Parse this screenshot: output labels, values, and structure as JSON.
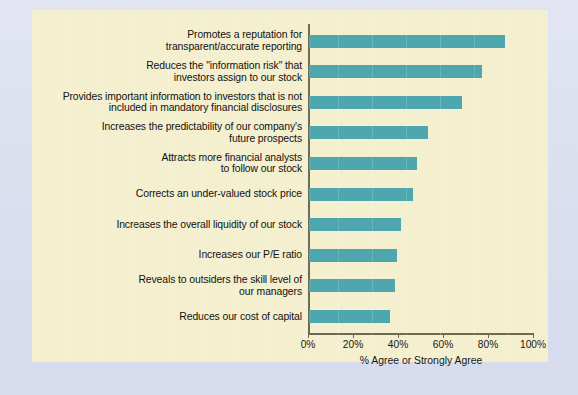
{
  "chart_data": {
    "type": "bar",
    "orientation": "horizontal",
    "title": "",
    "xlabel": "% Agree or Strongly Agree",
    "ylabel": "",
    "xlim": [
      0,
      100
    ],
    "xticks": [
      "0%",
      "20%",
      "40%",
      "60%",
      "80%",
      "100%"
    ],
    "xtick_values": [
      0,
      20,
      40,
      60,
      80,
      100
    ],
    "grid": false,
    "legend": null,
    "bar_color": "#4ea7ae",
    "panel_color": "#f4efcf",
    "page_color": "#dadeee",
    "categories": [
      "Promotes a reputation for transparent/accurate reporting",
      "Reduces the \"information risk\" that investors assign to our stock",
      "Provides important information to investors that is not included in mandatory financial disclosures",
      "Increases the predictability of our company's future prospects",
      "Attracts more financial analysts to follow our stock",
      "Corrects an under-valued stock price",
      "Increases the overall liquidity of our stock",
      "Increases our P/E ratio",
      "Reveals to outsiders the skill level of our managers",
      "Reduces our cost of capital"
    ],
    "values": [
      87,
      77,
      68,
      53,
      48,
      46,
      41,
      39,
      38,
      36
    ]
  },
  "rows": [
    {
      "line1": "Promotes a reputation for",
      "line2": "transparent/accurate reporting",
      "value": 87
    },
    {
      "line1": "Reduces the \"information risk\" that",
      "line2": "investors assign to our stock",
      "value": 77
    },
    {
      "line1": "Provides important information to investors that is not",
      "line2": "included in mandatory financial disclosures",
      "value": 68
    },
    {
      "line1": "Increases the predictability of our company's",
      "line2": "future prospects",
      "value": 53
    },
    {
      "line1": "Attracts more financial analysts",
      "line2": "to follow our stock",
      "value": 48
    },
    {
      "line1": "Corrects an under-valued stock price",
      "line2": "",
      "value": 46
    },
    {
      "line1": "Increases the overall liquidity of our stock",
      "line2": "",
      "value": 41
    },
    {
      "line1": "Increases our P/E ratio",
      "line2": "",
      "value": 39
    },
    {
      "line1": "Reveals to outsiders the skill level of",
      "line2": "our managers",
      "value": 38
    },
    {
      "line1": "Reduces our cost of capital",
      "line2": "",
      "value": 36
    }
  ],
  "axis": {
    "x_title": "% Agree or Strongly Agree",
    "ticks": [
      "0%",
      "20%",
      "40%",
      "60%",
      "80%",
      "100%"
    ]
  },
  "footnote": ""
}
